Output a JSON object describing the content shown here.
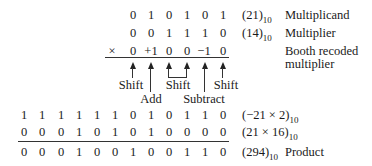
{
  "rows": {
    "multiplicand": {
      "bits": [
        "0",
        "1",
        "0",
        "1",
        "0",
        "1"
      ],
      "value": "(21)",
      "base": "10",
      "label": "Multiplicand"
    },
    "multiplier": {
      "bits": [
        "0",
        "0",
        "1",
        "1",
        "1",
        "0"
      ],
      "value": "(14)",
      "base": "10",
      "label": "Multiplier"
    },
    "booth": {
      "sign": "×",
      "bits": [
        "0",
        "+1",
        "0",
        "0",
        "−1",
        "0"
      ],
      "label_line1": "Booth recoded",
      "label_line2": "multiplier"
    },
    "partial1": {
      "bits": [
        "1",
        "1",
        "1",
        "1",
        "1",
        "1",
        "0",
        "1",
        "0",
        "1",
        "1",
        "0"
      ],
      "value": "(−21 × 2)",
      "base": "10"
    },
    "partial2": {
      "bits": [
        "0",
        "0",
        "0",
        "1",
        "0",
        "1",
        "0",
        "1",
        "0",
        "0",
        "0",
        "0"
      ],
      "value": "(21 × 16)",
      "base": "10"
    },
    "product": {
      "bits": [
        "0",
        "0",
        "0",
        "1",
        "0",
        "0",
        "1",
        "0",
        "0",
        "1",
        "1",
        "0"
      ],
      "value": "(294)",
      "base": "10",
      "label": "Product"
    }
  },
  "operations": {
    "shift1": "Shift",
    "add": "Add",
    "shift2": "Shift",
    "subtract": "Subtract",
    "shift3": "Shift"
  }
}
